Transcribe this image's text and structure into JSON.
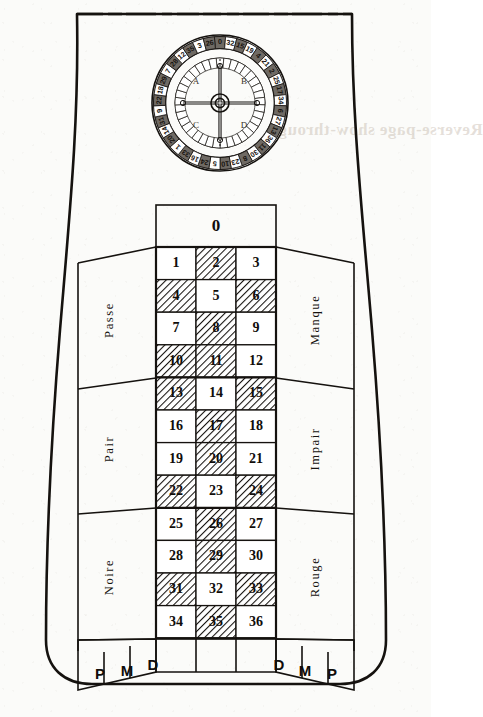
{
  "figure": {
    "paper_color": "#fbfbf9",
    "ink_color": "#15120f"
  },
  "wheel": {
    "name": "roulette-wheel",
    "center_x": 220,
    "center_y": 103,
    "outer_radius": 68,
    "rim_inner_radius": 55,
    "pocket_ring_radius": 46,
    "hub_radius": 9,
    "quadrant_labels": [
      "A",
      "B",
      "C",
      "D"
    ],
    "number_sequence": [
      0,
      32,
      15,
      19,
      4,
      21,
      2,
      25,
      17,
      34,
      6,
      27,
      13,
      36,
      11,
      30,
      8,
      23,
      10,
      5,
      24,
      16,
      33,
      1,
      20,
      14,
      31,
      9,
      22,
      18,
      29,
      7,
      28,
      12,
      35,
      3,
      26
    ],
    "red_numbers": [
      1,
      3,
      5,
      7,
      9,
      12,
      14,
      16,
      18,
      19,
      21,
      23,
      25,
      27,
      30,
      32,
      34,
      36
    ],
    "black_numbers": [
      2,
      4,
      6,
      8,
      10,
      11,
      13,
      15,
      17,
      20,
      22,
      24,
      26,
      28,
      29,
      31,
      33,
      35
    ]
  },
  "layout": {
    "zero": {
      "label": "0",
      "name": "bet-cell-0"
    },
    "columns": 3,
    "rows": 12,
    "numbers": [
      [
        1,
        2,
        3
      ],
      [
        4,
        5,
        6
      ],
      [
        7,
        8,
        9
      ],
      [
        10,
        11,
        12
      ],
      [
        13,
        14,
        15
      ],
      [
        16,
        17,
        18
      ],
      [
        19,
        20,
        21
      ],
      [
        22,
        23,
        24
      ],
      [
        25,
        26,
        27
      ],
      [
        28,
        29,
        30
      ],
      [
        31,
        32,
        33
      ],
      [
        34,
        35,
        36
      ]
    ],
    "shaded_numbers": [
      2,
      4,
      6,
      8,
      10,
      11,
      13,
      15,
      17,
      20,
      22,
      24,
      26,
      29,
      31,
      33,
      35
    ],
    "shading_meaning": "hatched cells mark the red numbers of the layout"
  },
  "side_bets": {
    "left": [
      {
        "label": "Passe",
        "name": "bet-passe"
      },
      {
        "label": "Pair",
        "name": "bet-pair"
      },
      {
        "label": "Noire",
        "name": "bet-noire"
      }
    ],
    "right": [
      {
        "label": "Manque",
        "name": "bet-manque"
      },
      {
        "label": "Impair",
        "name": "bet-impair"
      },
      {
        "label": "Rouge",
        "name": "bet-rouge"
      }
    ]
  },
  "dozens_row": {
    "left_letters": [
      "P",
      "M",
      "D"
    ],
    "right_letters": [
      "D",
      "M",
      "P"
    ],
    "letter_meanings": {
      "P": "Premiere douzaine",
      "M": "Milieu douzaine",
      "D": "Derniere douzaine"
    }
  },
  "bleedthrough": {
    "text": "Reverse-page show-through"
  }
}
